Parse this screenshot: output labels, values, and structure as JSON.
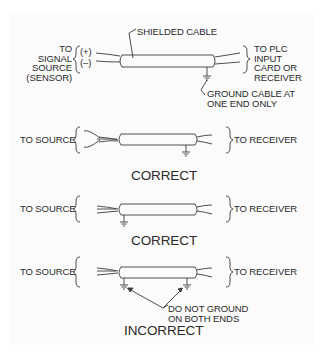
{
  "top_diagram": {
    "cable_label": "SHIELDED CABLE",
    "left_label_lines": [
      "TO",
      "SIGNAL",
      "SOURCE",
      "(SENSOR)"
    ],
    "polarity": [
      "(+)",
      "(–)"
    ],
    "right_label_lines": [
      "TO PLC",
      "INPUT",
      "CARD OR",
      "RECEIVER"
    ],
    "ground_note_lines": [
      "GROUND CABLE AT",
      "ONE END ONLY"
    ]
  },
  "examples": [
    {
      "left_label": "TO SOURCE",
      "right_label": "TO RECEIVER",
      "ground": "receiver-end",
      "verdict": "CORRECT"
    },
    {
      "left_label": "TO SOURCE",
      "right_label": "TO RECEIVER",
      "ground": "source-end",
      "verdict": "CORRECT"
    },
    {
      "left_label": "TO SOURCE",
      "right_label": "TO RECEIVER",
      "ground": "both-ends",
      "verdict": "INCORRECT",
      "note_lines": [
        "DO NOT GROUND",
        "ON BOTH ENDS"
      ]
    }
  ],
  "colors": {
    "line": "#3a3a3a",
    "background": "#ffffff",
    "panel": "#fbfbfb"
  }
}
